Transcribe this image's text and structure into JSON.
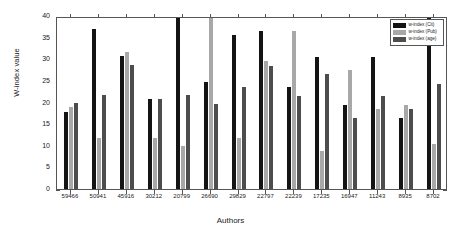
{
  "chart_data": {
    "type": "bar",
    "title": "",
    "xlabel": "Authors",
    "ylabel": "W-index value",
    "ylim": [
      0,
      40
    ],
    "yticks": [
      0,
      5,
      10,
      15,
      20,
      25,
      30,
      35,
      40
    ],
    "grid": false,
    "legend_position": "top-right",
    "categories": [
      "59466",
      "50941",
      "45916",
      "30212",
      "20799",
      "26690",
      "29829",
      "22797",
      "22239",
      "17235",
      "16947",
      "11243",
      "8935",
      "8702"
    ],
    "series": [
      {
        "name": "w-index (Cit)",
        "color": "#141414",
        "values": [
          17.8,
          36.9,
          30.8,
          20.7,
          40.0,
          24.7,
          35.6,
          36.6,
          23.6,
          30.5,
          19.5,
          30.5,
          16.4,
          40.0
        ]
      },
      {
        "name": "w-index (Pub)",
        "color": "#a8a8a8",
        "values": [
          18.9,
          11.9,
          31.6,
          11.8,
          9.9,
          40.0,
          11.7,
          29.6,
          36.6,
          8.7,
          27.5,
          18.5,
          19.4,
          10.5
        ]
      },
      {
        "name": "w-index (age)",
        "color": "#4d4d4d",
        "values": [
          19.8,
          21.8,
          28.7,
          20.7,
          21.7,
          19.6,
          23.6,
          28.5,
          21.5,
          26.6,
          16.4,
          21.4,
          18.4,
          24.3
        ]
      }
    ]
  },
  "axes": {
    "x_axis_label": "Authors",
    "y_axis_label": "W-index value"
  }
}
